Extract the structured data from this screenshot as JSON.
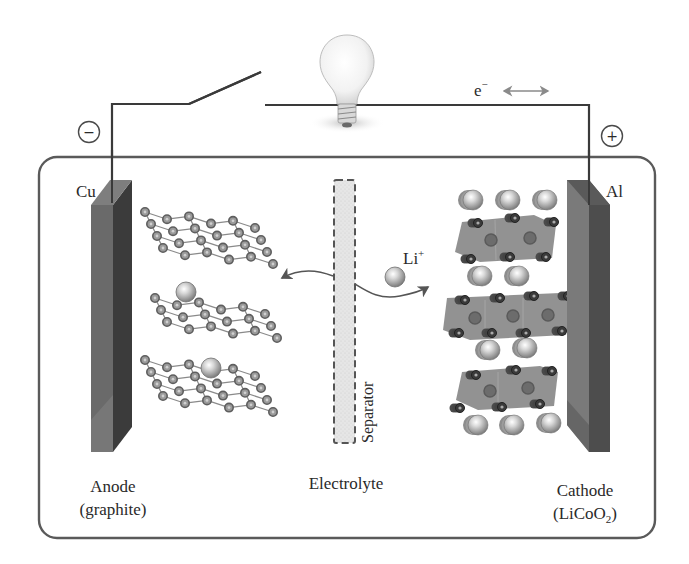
{
  "diagram": {
    "terminals": {
      "negative_symbol": "−",
      "positive_symbol": "+"
    },
    "current_collectors": {
      "left": "Cu",
      "right": "Al"
    },
    "electron_label": {
      "base": "e",
      "superscript": "−"
    },
    "ion_label": {
      "base": "Li",
      "superscript": "+"
    },
    "separator_label": "Separator",
    "bottom_labels": {
      "anode_line1": "Anode",
      "anode_line2": "(graphite)",
      "electrolyte": "Electrolyte",
      "cathode_line1": "Cathode",
      "cathode_line2_prefix": "(LiCoO",
      "cathode_line2_subscript": "2",
      "cathode_line2_suffix": ")"
    },
    "colors": {
      "wire": "#3a3a3a",
      "case_border": "#5a5a5a",
      "electrode_front": "#6b6b6b",
      "electrode_side": "#3c3c3c",
      "separator_fill": "#e4e4e4",
      "atom_ring": "#7a7a7a",
      "octahedron": "#8a8a8a",
      "li_ion": "#9a9a9a",
      "arrow": "#555555"
    }
  }
}
